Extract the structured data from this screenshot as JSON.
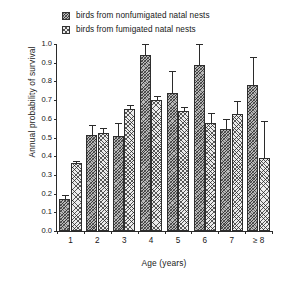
{
  "chart_data": {
    "type": "bar",
    "title": "",
    "xlabel": "Age (years)",
    "ylabel": "Annual probability of survival",
    "categories": [
      "1",
      "2",
      "3",
      "4",
      "5",
      "6",
      "7",
      "≥ 8"
    ],
    "ylim": [
      0.0,
      1.0
    ],
    "ytick_labels": [
      "0.0",
      "0.1",
      "0.2",
      "0.3",
      "0.4",
      "0.5",
      "0.6",
      "0.7",
      "0.8",
      "0.9",
      "1.0"
    ],
    "ytick_values": [
      0.0,
      0.1,
      0.2,
      0.3,
      0.4,
      0.5,
      0.6,
      0.7,
      0.8,
      0.9,
      1.0
    ],
    "grid": false,
    "legend_position": "top",
    "series": [
      {
        "name": "birds from nonfumigated natal nests",
        "pattern": "dense-crosshatch",
        "values": [
          0.17,
          0.515,
          0.51,
          0.94,
          0.74,
          0.89,
          0.545,
          0.78
        ],
        "errors_upper": [
          0.195,
          0.565,
          0.58,
          1.0,
          0.855,
          1.0,
          0.6,
          0.93
        ]
      },
      {
        "name": "birds from fumigated natal nests",
        "pattern": "light-dotted",
        "values": [
          0.365,
          0.525,
          0.655,
          0.7,
          0.64,
          0.575,
          0.625,
          0.39
        ],
        "errors_upper": [
          0.375,
          0.55,
          0.675,
          0.72,
          0.665,
          0.63,
          0.695,
          0.59
        ]
      }
    ]
  },
  "legend": {
    "items": [
      {
        "label": "birds from nonfumigated natal nests",
        "swatch": "nonfum"
      },
      {
        "label": "birds from fumigated natal nests",
        "swatch": "fum"
      }
    ]
  }
}
